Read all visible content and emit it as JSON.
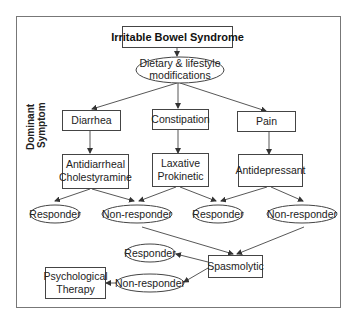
{
  "title": "Irritable Bowel Syndrome",
  "first_step": {
    "line1": "Dietary & lifestyle",
    "line2": "modifications"
  },
  "side_label": {
    "line1": "Dominant",
    "line2": "Symptom"
  },
  "symptoms": [
    {
      "label": "Diarrhea"
    },
    {
      "label": "Constipation"
    },
    {
      "label": "Pain"
    }
  ],
  "treatments": [
    {
      "line1": "Antidiarrheal",
      "line2": "Cholestyramine"
    },
    {
      "line1": "Laxative",
      "line2": "Prokinetic"
    },
    {
      "line1": "Antidepressant",
      "line2": ""
    }
  ],
  "outcomes_row1": [
    {
      "label": "Responder"
    },
    {
      "label": "Non-responder"
    },
    {
      "label": "Responder"
    },
    {
      "label": "Non-responder"
    }
  ],
  "spasmolytic": {
    "label": "Spasmolytic"
  },
  "outcomes_row2": [
    {
      "label": "Responder"
    },
    {
      "label": "Non-responder"
    }
  ],
  "final": {
    "line1": "Psychological",
    "line2": "Therapy"
  }
}
